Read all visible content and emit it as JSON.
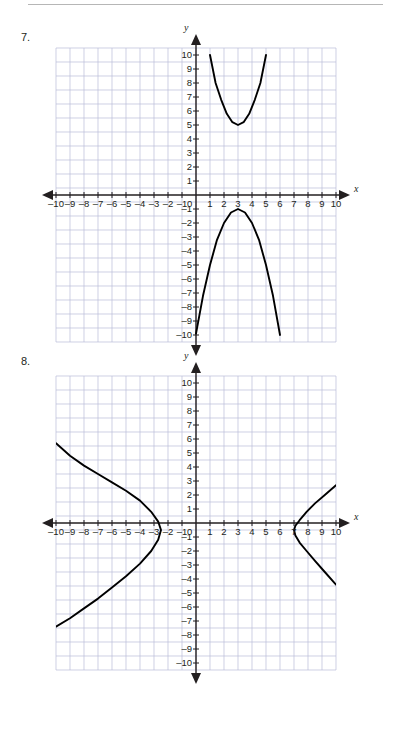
{
  "page": {
    "has_top_rule": true,
    "background": "#ffffff",
    "ink_color": "#231f20",
    "grid_color": "#b9bcd8",
    "curve_color": "#000000"
  },
  "problems": [
    {
      "number_label": "7.",
      "axis_x_name": "x",
      "axis_y_name": "y",
      "x_ticks": [
        "–10",
        "–9",
        "–8",
        "–7",
        "–6",
        "–5",
        "–4",
        "–3",
        "–2",
        "–1",
        "1",
        "2",
        "3",
        "4",
        "5",
        "6",
        "7",
        "8",
        "9",
        "10"
      ],
      "y_ticks": [
        "10",
        "9",
        "8",
        "7",
        "6",
        "5",
        "4",
        "3",
        "2",
        "1",
        "–1",
        "–2",
        "–3",
        "–4",
        "–5",
        "–6",
        "–7",
        "–8",
        "–9",
        "–10"
      ],
      "origin_label": "0",
      "chart_data": {
        "type": "line",
        "title": "Problem 7 coordinate grid with two parabolas",
        "xlabel": "x",
        "ylabel": "y",
        "xlim": [
          -10,
          10
        ],
        "ylim": [
          -10,
          10
        ],
        "grid": true,
        "legend": "none",
        "series": [
          {
            "name": "upward parabola",
            "vertex": [
              3,
              5
            ],
            "opens": "up",
            "a": 1.25,
            "points": [
              [
                1,
                10
              ],
              [
                1.4,
                8.0
              ],
              [
                1.8,
                6.8
              ],
              [
                2.2,
                5.8
              ],
              [
                2.6,
                5.2
              ],
              [
                3,
                5
              ],
              [
                3.4,
                5.2
              ],
              [
                3.8,
                5.8
              ],
              [
                4.2,
                6.8
              ],
              [
                4.6,
                8.0
              ],
              [
                5,
                10
              ]
            ]
          },
          {
            "name": "downward parabola",
            "vertex": [
              3,
              -1
            ],
            "opens": "down",
            "a": -1.0,
            "points": [
              [
                0.0,
                -9.9
              ],
              [
                0.5,
                -7.2
              ],
              [
                1.0,
                -5.0
              ],
              [
                1.5,
                -3.2
              ],
              [
                2.0,
                -2.0
              ],
              [
                2.5,
                -1.25
              ],
              [
                3,
                -1
              ],
              [
                3.5,
                -1.25
              ],
              [
                4.0,
                -2.0
              ],
              [
                4.5,
                -3.2
              ],
              [
                5.0,
                -5.0
              ],
              [
                5.5,
                -7.2
              ],
              [
                6.0,
                -10.0
              ]
            ]
          }
        ]
      }
    },
    {
      "number_label": "8.",
      "axis_x_name": "x",
      "axis_y_name": "y",
      "x_ticks": [
        "–10",
        "–9",
        "–8",
        "–7",
        "–6",
        "–5",
        "–4",
        "–3",
        "–2",
        "–1",
        "1",
        "2",
        "3",
        "4",
        "5",
        "6",
        "7",
        "8",
        "9",
        "10"
      ],
      "y_ticks": [
        "10",
        "9",
        "8",
        "7",
        "6",
        "5",
        "4",
        "3",
        "2",
        "1",
        "–1",
        "–2",
        "–3",
        "–4",
        "–5",
        "–6",
        "–7",
        "–8",
        "–9",
        "–10"
      ],
      "origin_label": "0",
      "chart_data": {
        "type": "line",
        "title": "Problem 8 coordinate grid with a horizontal hyperbola",
        "xlabel": "x",
        "ylabel": "y",
        "xlim": [
          -10,
          10
        ],
        "ylim": [
          -10,
          10
        ],
        "grid": true,
        "legend": "none",
        "series": [
          {
            "name": "left branch",
            "vertex": [
              -2.5,
              -0.5
            ],
            "opens": "left",
            "points": [
              [
                -10,
                5.7
              ],
              [
                -9,
                4.8
              ],
              [
                -8,
                4.1
              ],
              [
                -7,
                3.5
              ],
              [
                -6,
                2.9
              ],
              [
                -5,
                2.3
              ],
              [
                -4,
                1.6
              ],
              [
                -3.2,
                0.8
              ],
              [
                -2.7,
                0.1
              ],
              [
                -2.5,
                -0.5
              ],
              [
                -2.7,
                -1.2
              ],
              [
                -3.2,
                -2.0
              ],
              [
                -4,
                -2.9
              ],
              [
                -5,
                -3.8
              ],
              [
                -6,
                -4.6
              ],
              [
                -7,
                -5.4
              ],
              [
                -8,
                -6.1
              ],
              [
                -9,
                -6.8
              ],
              [
                -10,
                -7.4
              ]
            ]
          },
          {
            "name": "right branch",
            "vertex": [
              7,
              -0.5
            ],
            "opens": "right",
            "points": [
              [
                10,
                2.7
              ],
              [
                9.2,
                2.0
              ],
              [
                8.5,
                1.4
              ],
              [
                7.9,
                0.8
              ],
              [
                7.4,
                0.2
              ],
              [
                7.1,
                -0.2
              ],
              [
                7,
                -0.5
              ],
              [
                7.1,
                -0.9
              ],
              [
                7.4,
                -1.4
              ],
              [
                7.9,
                -2.0
              ],
              [
                8.5,
                -2.7
              ],
              [
                9.2,
                -3.5
              ],
              [
                10,
                -4.4
              ]
            ]
          }
        ]
      }
    }
  ]
}
